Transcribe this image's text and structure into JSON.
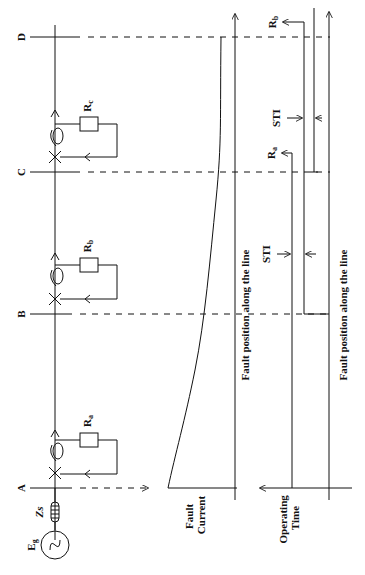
{
  "diagram": {
    "buses": [
      {
        "id": "A",
        "label": "A"
      },
      {
        "id": "B",
        "label": "B"
      },
      {
        "id": "C",
        "label": "C"
      },
      {
        "id": "D",
        "label": "D"
      }
    ],
    "source": {
      "label": "E",
      "subscript": "g"
    },
    "source_impedance": {
      "label": "Zs"
    },
    "relays": [
      {
        "label": "R",
        "subscript": "a",
        "bus": "A"
      },
      {
        "label": "R",
        "subscript": "b",
        "bus": "B"
      },
      {
        "label": "R",
        "subscript": "c",
        "bus": "C"
      }
    ],
    "fault_current_plot": {
      "ylabel_line1": "Fault",
      "ylabel_line2": "Current",
      "xlabel": "Fault position along the line"
    },
    "operating_time_plot": {
      "ylabel_line1": "Operating",
      "ylabel_line2": "Time",
      "xlabel": "Fault position along the line",
      "curves": [
        {
          "label": "R",
          "subscript": "a"
        },
        {
          "label": "R",
          "subscript": "b"
        }
      ],
      "sti_labels": [
        "STI",
        "STI"
      ]
    }
  }
}
